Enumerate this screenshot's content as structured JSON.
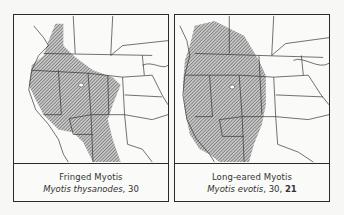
{
  "panels": [
    {
      "common_name": "Fringed Myotis",
      "scientific_name": "Myotis thysanodes",
      "refs": ", 30",
      "bold_ref": ""
    },
    {
      "common_name": "Long-eared Myotis",
      "scientific_name": "Myotis evotis",
      "refs": ", 30, ",
      "bold_ref": "21"
    }
  ],
  "colors": {
    "range_fill": "#9a9a9a",
    "border": "#2a2a2a",
    "background": "#fafaf8"
  }
}
